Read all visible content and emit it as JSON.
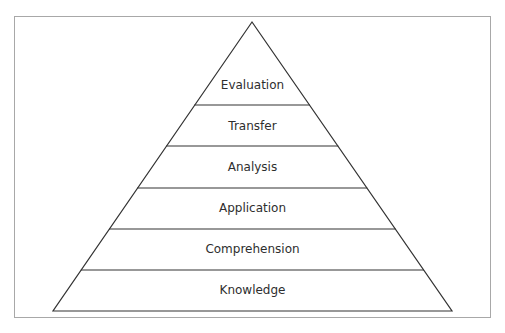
{
  "diagram": {
    "type": "pyramid",
    "layers_top_to_bottom": [
      {
        "label": "Evaluation"
      },
      {
        "label": "Transfer"
      },
      {
        "label": "Analysis"
      },
      {
        "label": "Application"
      },
      {
        "label": "Comprehension"
      },
      {
        "label": "Knowledge"
      }
    ],
    "colors": {
      "line": "#333333",
      "frame": "#a8a8a8",
      "text": "#2e2e2e",
      "fill": "#ffffff"
    }
  }
}
